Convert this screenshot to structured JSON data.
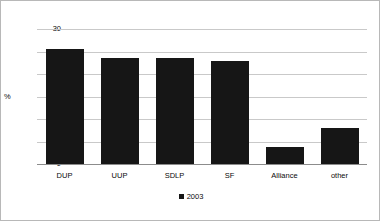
{
  "chart_data": {
    "type": "bar",
    "title": "",
    "subtitle": "",
    "xlabel": "",
    "ylabel": "%",
    "categories": [
      "DUP",
      "UUP",
      "SDLP",
      "SF",
      "Alliance",
      "other"
    ],
    "series": [
      {
        "name": "2003",
        "values": [
          25.6,
          23.5,
          23.6,
          22.8,
          3.8,
          8.0
        ],
        "color": "#161616"
      }
    ],
    "ylim": [
      0,
      30
    ],
    "ytick_labels": [
      "0",
      "5",
      "10",
      "15",
      "20",
      "25",
      "30"
    ],
    "ytick_values": [
      0,
      5,
      10,
      15,
      20,
      25,
      30
    ],
    "grid": true,
    "grid_color": "#c9c9c9",
    "legend": {
      "position": "bottom-center",
      "entries": [
        {
          "label": "2003",
          "marker": "square",
          "color": "#161616"
        }
      ]
    },
    "background_color": "#ffffff",
    "border_color": "#b8b8b8"
  }
}
